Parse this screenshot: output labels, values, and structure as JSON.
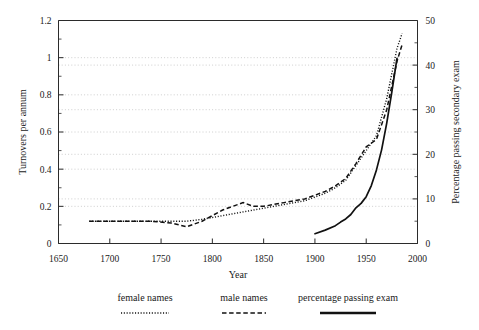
{
  "chart_data": {
    "type": "line",
    "title": "",
    "xlabel": "Year",
    "ylabel": "Turnovers per annum",
    "y2label": "Percentage passing secondary exam",
    "xlim": [
      1650,
      2000
    ],
    "ylim": [
      0,
      1.2
    ],
    "y2lim": [
      0,
      50
    ],
    "grid": true,
    "legend_position": "bottom",
    "xticks": [
      1650,
      1700,
      1750,
      1800,
      1850,
      1900,
      1950,
      2000
    ],
    "xtick_labels": [
      "1650",
      "1700",
      "1750",
      "1800",
      "1850",
      "1900",
      "1950",
      "2000"
    ],
    "yticks": [
      0,
      0.2,
      0.4,
      0.6,
      0.8,
      1,
      1.2
    ],
    "ytick_labels": [
      "0",
      "0.2",
      "0.4",
      "0.6",
      "0.8",
      "1",
      "1.2"
    ],
    "y_minor_ticks": [
      0.1,
      0.3,
      0.5,
      0.7,
      0.9,
      1.1
    ],
    "y2ticks": [
      0,
      10,
      20,
      30,
      40,
      50
    ],
    "y2tick_labels": [
      "0",
      "10",
      "20",
      "30",
      "40",
      "50"
    ],
    "y2_minor_ticks": [
      5,
      15,
      25,
      35,
      45
    ],
    "series": [
      {
        "name": "female names",
        "axis": "left",
        "style": "dotted",
        "x": [
          1680,
          1700,
          1720,
          1740,
          1760,
          1775,
          1790,
          1800,
          1810,
          1820,
          1830,
          1840,
          1850,
          1860,
          1870,
          1880,
          1890,
          1900,
          1910,
          1920,
          1930,
          1940,
          1950,
          1960,
          1970,
          1980,
          1985
        ],
        "values": [
          0.12,
          0.12,
          0.12,
          0.12,
          0.12,
          0.12,
          0.13,
          0.14,
          0.15,
          0.16,
          0.17,
          0.18,
          0.19,
          0.2,
          0.21,
          0.22,
          0.23,
          0.25,
          0.27,
          0.3,
          0.34,
          0.42,
          0.5,
          0.58,
          0.78,
          1.05,
          1.13
        ]
      },
      {
        "name": "male names",
        "axis": "left",
        "style": "dashed",
        "x": [
          1680,
          1700,
          1720,
          1740,
          1760,
          1775,
          1790,
          1800,
          1810,
          1820,
          1830,
          1840,
          1850,
          1860,
          1870,
          1880,
          1890,
          1900,
          1910,
          1920,
          1930,
          1940,
          1950,
          1960,
          1970,
          1980,
          1985
        ],
        "values": [
          0.12,
          0.12,
          0.12,
          0.12,
          0.11,
          0.09,
          0.12,
          0.15,
          0.18,
          0.2,
          0.22,
          0.2,
          0.2,
          0.21,
          0.22,
          0.23,
          0.24,
          0.26,
          0.28,
          0.31,
          0.35,
          0.43,
          0.52,
          0.56,
          0.72,
          0.98,
          1.07
        ]
      },
      {
        "name": "percentage passing exam",
        "axis": "right",
        "style": "solid",
        "x": [
          1900,
          1910,
          1920,
          1925,
          1930,
          1935,
          1940,
          1945,
          1950,
          1955,
          1960,
          1965,
          1970,
          1975,
          1980
        ],
        "values": [
          2.2,
          3.0,
          4.0,
          4.8,
          5.5,
          6.5,
          8.0,
          9.0,
          10.5,
          13.0,
          16.5,
          21.0,
          27.0,
          34.0,
          41.5
        ]
      }
    ]
  },
  "legend": {
    "items": [
      {
        "label": "female names",
        "style": "dotted"
      },
      {
        "label": "male names",
        "style": "dashed"
      },
      {
        "label": "percentage passing exam",
        "style": "solid"
      }
    ]
  }
}
